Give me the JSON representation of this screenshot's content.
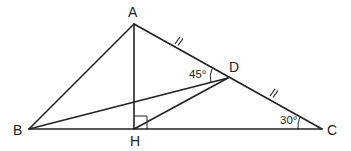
{
  "diagram": {
    "type": "geometry-triangle",
    "stroke_color": "#222222",
    "background": "#ffffff",
    "points": {
      "A": {
        "label": "A",
        "x": 134,
        "y": 24
      },
      "B": {
        "label": "B",
        "x": 29,
        "y": 129
      },
      "C": {
        "label": "C",
        "x": 322,
        "y": 129
      },
      "D": {
        "label": "D",
        "x": 228,
        "y": 78
      },
      "H": {
        "label": "H",
        "x": 134,
        "y": 129
      }
    },
    "segments": [
      "AB",
      "AC",
      "BC",
      "AH",
      "BD",
      "HD"
    ],
    "angles": {
      "ADB": {
        "label": "45°"
      },
      "ACB": {
        "label": "30°"
      }
    },
    "right_angle": "AHC",
    "equal_marks": [
      "AD",
      "DC"
    ]
  }
}
